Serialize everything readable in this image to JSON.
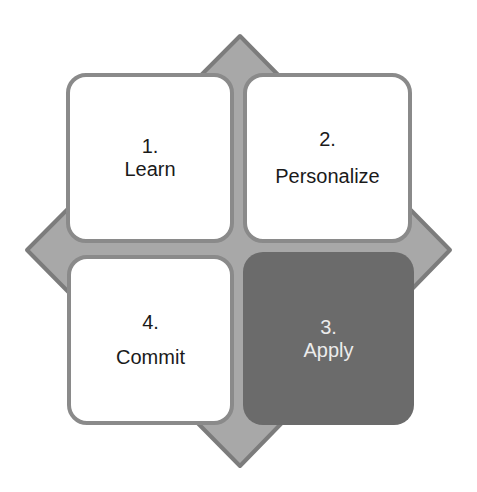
{
  "diagram": {
    "colors": {
      "background": "#ffffff",
      "diamond_fill": "#a8a8a8",
      "diamond_stroke": "#7c7c7c",
      "box_fill": "#ffffff",
      "box_border": "#8a8a8a",
      "highlight_fill": "#6b6b6b",
      "text_dark": "#1a1a1a",
      "text_light": "#ececec"
    },
    "steps": [
      {
        "number": "1.",
        "label": "Learn",
        "position": "top-left",
        "highlighted": false
      },
      {
        "number": "2.",
        "label": "Personalize",
        "position": "top-right",
        "highlighted": false
      },
      {
        "number": "3.",
        "label": "Apply",
        "position": "bottom-right",
        "highlighted": true
      },
      {
        "number": "4.",
        "label": "Commit",
        "position": "bottom-left",
        "highlighted": false
      }
    ]
  }
}
